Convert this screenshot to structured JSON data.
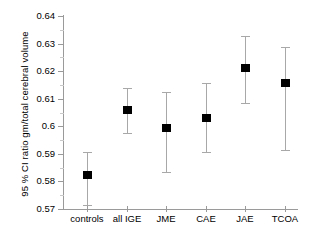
{
  "chart_data": {
    "type": "scatter",
    "title": "",
    "xlabel": "",
    "ylabel": "95 % CI ratio gm/total cerebral volume",
    "ylim": [
      0.57,
      0.64
    ],
    "ytick_labels": [
      "0.64",
      "0.63",
      "0.62",
      "0.61",
      "0.6",
      "0.59",
      "0.58",
      "0.57"
    ],
    "ytick_values": [
      0.64,
      0.63,
      0.62,
      0.61,
      0.6,
      0.59,
      0.58,
      0.57
    ],
    "grid": false,
    "legend": "none",
    "categories": [
      "controls",
      "all IGE",
      "JME",
      "CAE",
      "JAE",
      "TCOA"
    ],
    "values": [
      0.5823,
      0.6059,
      0.5993,
      0.603,
      0.6211,
      0.6157
    ],
    "ci_lower": [
      0.5715,
      0.5975,
      0.5834,
      0.5906,
      0.6084,
      0.5913
    ],
    "ci_upper": [
      0.5906,
      0.6138,
      0.6124,
      0.6157,
      0.6327,
      0.6287
    ],
    "series": [
      {
        "name": "95 % CI ratio gm/total cerebral volume",
        "points": [
          {
            "category": "controls",
            "mean": 0.5823,
            "lower": 0.5715,
            "upper": 0.5906
          },
          {
            "category": "all IGE",
            "mean": 0.6059,
            "lower": 0.5975,
            "upper": 0.6138
          },
          {
            "category": "JME",
            "mean": 0.5993,
            "lower": 0.5834,
            "upper": 0.6124
          },
          {
            "category": "CAE",
            "mean": 0.603,
            "lower": 0.5906,
            "upper": 0.6157
          },
          {
            "category": "JAE",
            "mean": 0.6211,
            "lower": 0.6084,
            "upper": 0.6327
          },
          {
            "category": "TCOA",
            "mean": 0.6157,
            "lower": 0.5913,
            "upper": 0.6287
          }
        ]
      }
    ],
    "colors": {
      "marker": "#000000",
      "errorbar": "#a8a8a8",
      "axis": "#9a9a9a",
      "background": "#ffffff",
      "text": "#000000"
    }
  }
}
